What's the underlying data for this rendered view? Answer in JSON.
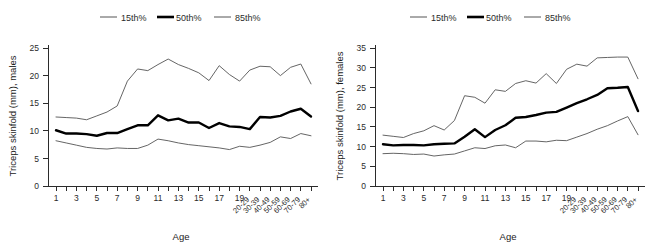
{
  "figure": {
    "background_color": "#ffffff",
    "panel_count": 2
  },
  "legend": {
    "position": "top-center",
    "entries": [
      {
        "label": "15th%",
        "style": "thin",
        "color": "#545454"
      },
      {
        "label": "50th%",
        "style": "thick",
        "color": "#000000"
      },
      {
        "label": "85th%",
        "style": "thin",
        "color": "#545454"
      }
    ]
  },
  "axes": {
    "xlabel": "Age",
    "x_tick_labels": [
      "1",
      "3",
      "5",
      "7",
      "9",
      "11",
      "13",
      "15",
      "17",
      "19",
      "20-29",
      "30-39",
      "40-49",
      "50-59",
      "60-69",
      "70-79",
      "80+"
    ],
    "x_rotated_labels": [
      "20-29",
      "30-39",
      "40-49",
      "50-59",
      "60-69",
      "70-79",
      "80+"
    ],
    "males_ylabel": "Triceps skinfold (mm), males",
    "females_ylabel": "Triceps skinfold (mm), females",
    "males_y_ticks": [
      "0",
      "5",
      "10",
      "15",
      "20",
      "25"
    ],
    "females_y_ticks": [
      "0",
      "5",
      "10",
      "15",
      "20",
      "25",
      "30",
      "35"
    ]
  },
  "chart_data": [
    {
      "type": "line",
      "title": "",
      "panel": "males",
      "xlabel": "Age",
      "ylabel": "Triceps skinfold (mm), males",
      "ylim": [
        0,
        25
      ],
      "yticks": [
        0,
        5,
        10,
        15,
        20,
        25
      ],
      "grid": false,
      "legend_position": "top-center",
      "categories": [
        "1",
        "2",
        "3",
        "4",
        "5",
        "6",
        "7",
        "8",
        "9",
        "10",
        "11",
        "12",
        "13",
        "14",
        "15",
        "16",
        "17",
        "18",
        "19",
        "20-29",
        "30-39",
        "40-49",
        "50-59",
        "60-69",
        "70-79",
        "80+"
      ],
      "series": [
        {
          "name": "15th%",
          "style": "thin",
          "values": [
            8.2,
            7.8,
            7.4,
            7.0,
            6.8,
            6.7,
            6.9,
            6.8,
            6.8,
            7.4,
            8.5,
            8.2,
            7.8,
            7.5,
            7.3,
            7.1,
            6.9,
            6.6,
            7.2,
            7.0,
            7.4,
            7.9,
            8.9,
            8.6,
            9.5,
            9.1
          ]
        },
        {
          "name": "50th%",
          "style": "thick",
          "values": [
            10.1,
            9.5,
            9.5,
            9.4,
            9.1,
            9.6,
            9.6,
            10.3,
            11.0,
            11.0,
            12.8,
            11.9,
            12.2,
            11.5,
            11.5,
            10.5,
            11.4,
            10.8,
            10.7,
            10.3,
            12.5,
            12.4,
            12.7,
            13.5,
            14.0,
            12.6
          ]
        },
        {
          "name": "85th%",
          "style": "thin",
          "values": [
            12.5,
            12.4,
            12.3,
            12.0,
            12.7,
            13.4,
            14.5,
            19.0,
            21.2,
            20.9,
            22.0,
            23.0,
            22.0,
            21.3,
            20.5,
            19.1,
            21.8,
            20.2,
            19.0,
            21.0,
            21.7,
            21.6,
            20.0,
            21.5,
            22.1,
            18.5
          ]
        }
      ]
    },
    {
      "type": "line",
      "title": "",
      "panel": "females",
      "xlabel": "Age",
      "ylabel": "Triceps skinfold (mm), females",
      "ylim": [
        0,
        35
      ],
      "yticks": [
        0,
        5,
        10,
        15,
        20,
        25,
        30,
        35
      ],
      "grid": false,
      "legend_position": "top-center",
      "categories": [
        "1",
        "2",
        "3",
        "4",
        "5",
        "6",
        "7",
        "8",
        "9",
        "10",
        "11",
        "12",
        "13",
        "14",
        "15",
        "16",
        "17",
        "18",
        "19",
        "20-29",
        "30-39",
        "40-49",
        "50-59",
        "60-69",
        "70-79",
        "80+"
      ],
      "series": [
        {
          "name": "15th%",
          "style": "thin",
          "values": [
            8.2,
            8.3,
            8.2,
            8.0,
            8.1,
            7.6,
            7.9,
            8.1,
            8.9,
            9.7,
            9.5,
            10.2,
            10.4,
            9.7,
            11.4,
            11.4,
            11.2,
            11.6,
            11.5,
            12.4,
            13.3,
            14.4,
            15.3,
            16.5,
            17.6,
            13.0
          ]
        },
        {
          "name": "50th%",
          "style": "thick",
          "values": [
            10.6,
            10.3,
            10.4,
            10.4,
            10.3,
            10.6,
            10.7,
            10.8,
            12.5,
            14.4,
            12.4,
            14.2,
            15.4,
            17.3,
            17.5,
            18.0,
            18.6,
            18.8,
            19.9,
            21.0,
            22.0,
            23.1,
            24.8,
            24.9,
            25.1,
            19.0
          ]
        },
        {
          "name": "85th%",
          "style": "thin",
          "values": [
            12.9,
            12.6,
            12.3,
            13.3,
            14.0,
            15.3,
            14.2,
            16.6,
            22.9,
            22.5,
            21.0,
            24.4,
            24.0,
            26.0,
            26.7,
            26.1,
            28.5,
            26.0,
            29.6,
            30.9,
            30.4,
            32.5,
            32.6,
            32.7,
            32.7,
            27.2
          ]
        }
      ]
    }
  ]
}
